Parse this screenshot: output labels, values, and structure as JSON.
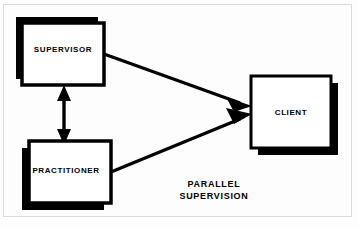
{
  "diagram": {
    "caption": {
      "line1": "PARALLEL",
      "line2": "SUPERVISION"
    },
    "nodes": [
      {
        "id": "supervisor",
        "label": "SUPERVISOR",
        "shape": "rectangle",
        "fill": "#ffffff",
        "stroke": "#000000",
        "shadow_color": "#000000",
        "shadow_offset": "up-left",
        "x": 22,
        "y": 23,
        "width": 82,
        "height": 62
      },
      {
        "id": "practitioner",
        "label": "PRACTITIONER",
        "shape": "rectangle",
        "fill": "#ffffff",
        "stroke": "#000000",
        "shadow_color": "#000000",
        "shadow_offset": "down-left",
        "x": 29,
        "y": 141,
        "width": 82,
        "height": 62
      },
      {
        "id": "client",
        "label": "CLIENT",
        "shape": "rectangle",
        "fill": "#ffffff",
        "stroke": "#000000",
        "shadow_color": "#000000",
        "shadow_offset": "down-right",
        "x": 251,
        "y": 76,
        "width": 80,
        "height": 72
      }
    ],
    "edges": [
      {
        "id": "supervisor-to-client",
        "from": "supervisor",
        "to": "client",
        "arrowheads": "single-end",
        "color": "#000000"
      },
      {
        "id": "practitioner-to-client",
        "from": "practitioner",
        "to": "client",
        "arrowheads": "single-end",
        "color": "#000000"
      },
      {
        "id": "supervisor-practitioner",
        "from": "supervisor",
        "to": "practitioner",
        "arrowheads": "double",
        "color": "#000000"
      }
    ],
    "colors": {
      "background": "#fdfdfd",
      "ink": "#000000",
      "frame": "#d9d9d9"
    }
  }
}
